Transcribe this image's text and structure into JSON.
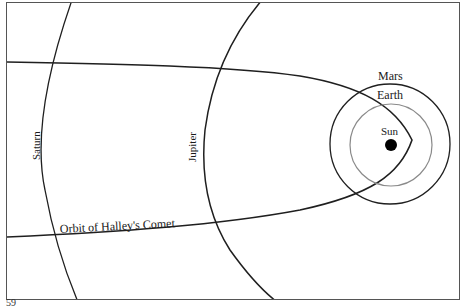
{
  "diagram": {
    "labels": {
      "saturn": "Saturn",
      "jupiter": "Jupiter",
      "mars": "Mars",
      "earth": "Earth",
      "sun": "Sun",
      "comet_orbit": "Orbit of Halley's Comet"
    },
    "colors": {
      "line": "#1f1f1f",
      "earth_orbit": "#8a8a8a",
      "sun": "#000000",
      "frame": "#555555"
    }
  },
  "page": {
    "number": "59"
  }
}
